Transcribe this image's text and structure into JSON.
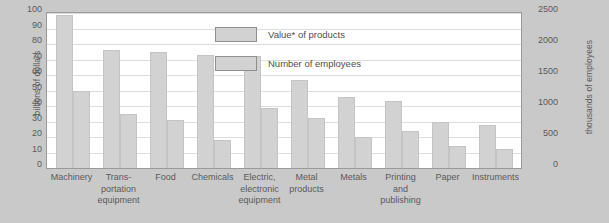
{
  "chart_data": {
    "type": "bar",
    "title": "",
    "subtitle": "",
    "xlabel": "",
    "categories": [
      "Machinery",
      "Trans-portation equipment",
      "Food",
      "Chemicals",
      "Electric, electronic equipment",
      "Metal products",
      "Metals",
      "Printing and publishing",
      "Paper",
      "Instruments"
    ],
    "category_lines": [
      [
        "Machinery"
      ],
      [
        "Trans-",
        "portation",
        "equipment"
      ],
      [
        "Food"
      ],
      [
        "Chemicals"
      ],
      [
        "Electric,",
        "electronic",
        "equipment"
      ],
      [
        "Metal",
        "products"
      ],
      [
        "Metals"
      ],
      [
        "Printing",
        "and",
        "publishing"
      ],
      [
        "Paper"
      ],
      [
        "Instruments"
      ]
    ],
    "series": [
      {
        "name": "Value* of products",
        "axis": "left",
        "unit": "billions of dollars",
        "values": [
          99,
          76,
          75,
          73,
          72,
          57,
          46,
          43,
          30,
          28
        ]
      },
      {
        "name": "Number of employees",
        "axis": "right",
        "unit": "thousands of employees",
        "values": [
          1250,
          875,
          775,
          450,
          975,
          800,
          500,
          600,
          350,
          300
        ]
      }
    ],
    "ylabel": "billions of dollars",
    "ylabel_right": "thousands of employees",
    "ylim": [
      0,
      100
    ],
    "ylim_right": [
      0,
      2500
    ],
    "yticks": [
      0,
      10,
      20,
      30,
      40,
      50,
      60,
      70,
      80,
      90,
      100
    ],
    "yticks_right": [
      0,
      500,
      1000,
      1500,
      2000,
      2500
    ],
    "grid": true,
    "legend_position": "inside-top-right",
    "bar_color": "#d2d2d2",
    "plot_background": "#ffffff",
    "page_background": "#c9c9c9",
    "grid_color": "#dcdcdc"
  },
  "axes": {
    "left": {
      "title": "billions of dollars",
      "ticks": [
        "100",
        "90",
        "80",
        "70",
        "60",
        "50",
        "40",
        "30",
        "20",
        "10",
        "0"
      ]
    },
    "right": {
      "title": "thousands of employees",
      "ticks": [
        "2500",
        "2000",
        "1500",
        "1000",
        "500",
        "0"
      ]
    }
  },
  "legend": {
    "items": [
      {
        "label": "Value* of products"
      },
      {
        "label": "Number of employees"
      }
    ]
  }
}
